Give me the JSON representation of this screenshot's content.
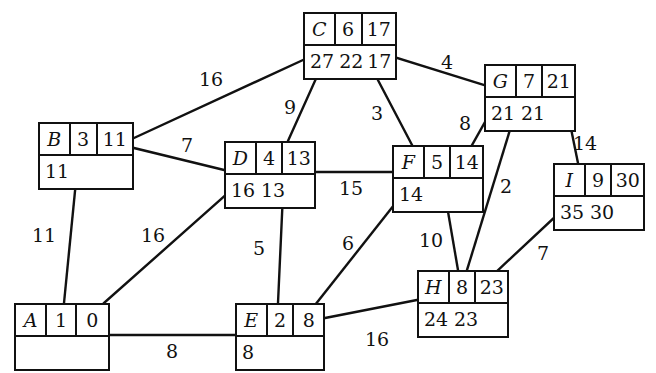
{
  "diagram": {
    "stroke_color": "#111111",
    "background_color": "#ffffff",
    "nodes": [
      {
        "id": "A",
        "name": "A",
        "top": [
          "A",
          "1",
          "0"
        ],
        "bottom": [
          ""
        ],
        "x": 14,
        "y": 303,
        "w": 96,
        "widths": [
          30,
          30,
          34
        ]
      },
      {
        "id": "B",
        "name": "B",
        "top": [
          "B",
          "3",
          "11"
        ],
        "bottom": [
          "11"
        ],
        "x": 38,
        "y": 122,
        "w": 96,
        "widths": [
          30,
          28,
          38
        ]
      },
      {
        "id": "C",
        "name": "C",
        "top": [
          "C",
          "6",
          "17"
        ],
        "bottom": [
          "27",
          "22",
          "17"
        ],
        "x": 303,
        "y": 12,
        "w": 94,
        "widths": [
          30,
          28,
          36
        ]
      },
      {
        "id": "D",
        "name": "D",
        "top": [
          "D",
          "4",
          "13"
        ],
        "bottom": [
          "16",
          "13"
        ],
        "x": 224,
        "y": 141,
        "w": 92,
        "widths": [
          30,
          28,
          34
        ]
      },
      {
        "id": "E",
        "name": "E",
        "top": [
          "E",
          "2",
          "8"
        ],
        "bottom": [
          "8"
        ],
        "x": 235,
        "y": 303,
        "w": 90,
        "widths": [
          30,
          28,
          32
        ]
      },
      {
        "id": "F",
        "name": "F",
        "top": [
          "F",
          "5",
          "14"
        ],
        "bottom": [
          "14"
        ],
        "x": 392,
        "y": 145,
        "w": 92,
        "widths": [
          30,
          28,
          34
        ]
      },
      {
        "id": "G",
        "name": "G",
        "top": [
          "G",
          "7",
          "21"
        ],
        "bottom": [
          "21",
          "21"
        ],
        "x": 484,
        "y": 64,
        "w": 92,
        "widths": [
          30,
          28,
          34
        ]
      },
      {
        "id": "H",
        "name": "H",
        "top": [
          "H",
          "8",
          "23"
        ],
        "bottom": [
          "24",
          "23"
        ],
        "x": 417,
        "y": 270,
        "w": 92,
        "widths": [
          30,
          28,
          34
        ]
      },
      {
        "id": "I",
        "name": "I",
        "top": [
          "I",
          "9",
          "30"
        ],
        "bottom": [
          "35",
          "30"
        ],
        "x": 553,
        "y": 163,
        "w": 92,
        "widths": [
          30,
          28,
          34
        ]
      }
    ],
    "edges": [
      {
        "from": "B",
        "to": "C",
        "weight": "16",
        "x1": 134,
        "y1": 138,
        "x2": 303,
        "y2": 60,
        "lx": 211,
        "ly": 79
      },
      {
        "from": "C",
        "to": "D",
        "weight": "9",
        "x1": 323,
        "y1": 63,
        "x2": 288,
        "y2": 141,
        "lx": 290,
        "ly": 107
      },
      {
        "from": "C",
        "to": "F",
        "weight": "3",
        "x1": 369,
        "y1": 63,
        "x2": 412,
        "y2": 145,
        "lx": 377,
        "ly": 113
      },
      {
        "from": "C",
        "to": "G",
        "weight": "4",
        "x1": 397,
        "y1": 58,
        "x2": 484,
        "y2": 85,
        "lx": 447,
        "ly": 62
      },
      {
        "from": "B",
        "to": "D",
        "weight": "7",
        "x1": 134,
        "y1": 148,
        "x2": 224,
        "y2": 170,
        "lx": 187,
        "ly": 145
      },
      {
        "from": "F",
        "to": "G",
        "weight": "8",
        "x1": 472,
        "y1": 145,
        "x2": 498,
        "y2": 99,
        "lx": 465,
        "ly": 123
      },
      {
        "from": "G",
        "to": "I",
        "weight": "14",
        "x1": 565,
        "y1": 99,
        "x2": 578,
        "y2": 163,
        "lx": 585,
        "ly": 143
      },
      {
        "from": "D",
        "to": "F",
        "weight": "15",
        "x1": 316,
        "y1": 172,
        "x2": 392,
        "y2": 172,
        "lx": 351,
        "ly": 188
      },
      {
        "from": "A",
        "to": "B",
        "weight": "11",
        "x1": 64,
        "y1": 303,
        "x2": 76,
        "y2": 181,
        "lx": 44,
        "ly": 235
      },
      {
        "from": "A",
        "to": "D",
        "weight": "16",
        "x1": 104,
        "y1": 303,
        "x2": 228,
        "y2": 193,
        "lx": 153,
        "ly": 235
      },
      {
        "from": "D",
        "to": "E",
        "weight": "5",
        "x1": 283,
        "y1": 193,
        "x2": 278,
        "y2": 303,
        "lx": 259,
        "ly": 248
      },
      {
        "from": "E",
        "to": "F",
        "weight": "6",
        "x1": 315,
        "y1": 305,
        "x2": 398,
        "y2": 200,
        "lx": 348,
        "ly": 243
      },
      {
        "from": "F",
        "to": "H",
        "weight": "10",
        "x1": 446,
        "y1": 200,
        "x2": 458,
        "y2": 270,
        "lx": 431,
        "ly": 240
      },
      {
        "from": "G",
        "to": "H",
        "weight": "2",
        "x1": 513,
        "y1": 120,
        "x2": 467,
        "y2": 270,
        "lx": 506,
        "ly": 186
      },
      {
        "from": "I",
        "to": "H",
        "weight": "7",
        "x1": 557,
        "y1": 215,
        "x2": 495,
        "y2": 273,
        "lx": 543,
        "ly": 253
      },
      {
        "from": "A",
        "to": "E",
        "weight": "8",
        "x1": 110,
        "y1": 335,
        "x2": 235,
        "y2": 335,
        "lx": 172,
        "ly": 351
      },
      {
        "from": "E",
        "to": "H",
        "weight": "16",
        "x1": 325,
        "y1": 318,
        "x2": 417,
        "y2": 300,
        "lx": 377,
        "ly": 339
      }
    ]
  }
}
